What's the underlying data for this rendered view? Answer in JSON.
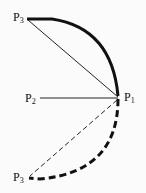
{
  "diagram": {
    "points": {
      "p1": {
        "label": "P",
        "sub": "1"
      },
      "p2": {
        "label": "P",
        "sub": "2"
      },
      "p3_top": {
        "label": "P",
        "sub": "3"
      },
      "p3_bottom": {
        "label": "P",
        "sub": "3"
      }
    },
    "elements": [
      "solid thick arc from P3 (top) to P1",
      "thin chord from P3 (top) to P1",
      "horizontal line from P2 to P1",
      "dashed thick arc from P1 to P3 (bottom)",
      "dashed thin chord from P1 to P3 (bottom)"
    ],
    "colors": {
      "stroke": "#111111",
      "background": "#fbfbfb"
    }
  }
}
